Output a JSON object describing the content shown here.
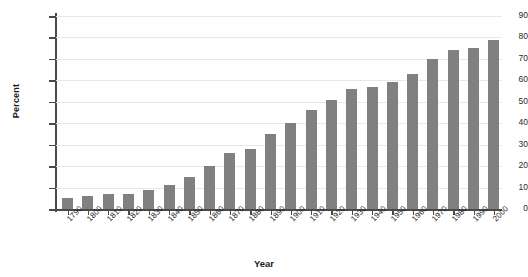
{
  "chart_data": {
    "type": "bar",
    "title": "",
    "xlabel": "Year",
    "ylabel": "Percent",
    "categories": [
      "1790",
      "1800",
      "1810",
      "1820",
      "1830",
      "1840",
      "1850",
      "1860",
      "1870",
      "1880",
      "1890",
      "1900",
      "1910",
      "1920",
      "1930",
      "1940",
      "1950",
      "1960",
      "1970",
      "1980",
      "1990",
      "2000"
    ],
    "values": [
      5,
      6,
      7,
      7,
      9,
      11,
      15,
      20,
      26,
      28,
      35,
      40,
      46,
      51,
      56,
      57,
      59,
      63,
      70,
      74,
      75,
      79
    ],
    "ylim": [
      0,
      90
    ],
    "ytick_labels": [
      "0",
      "10",
      "20",
      "30",
      "40",
      "50",
      "60",
      "70",
      "80",
      "90"
    ],
    "ytick_values": [
      0,
      10,
      20,
      30,
      40,
      50,
      60,
      70,
      80,
      90
    ],
    "grid": true,
    "legend": "none",
    "bar_color": "#808080",
    "axis_color": "#4a4a4a",
    "gridline_color": "#e8e8e8",
    "background_color": "#ffffff"
  }
}
